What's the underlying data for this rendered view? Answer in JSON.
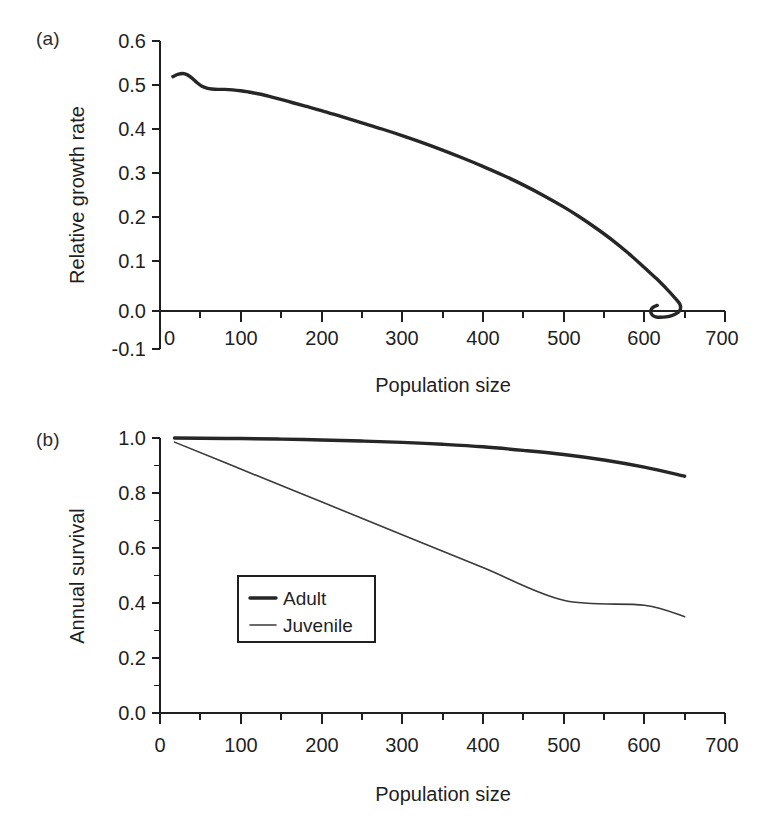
{
  "figure": {
    "panel_a_letter": "(a)",
    "panel_b_letter": "(b)",
    "line_color": "#262626",
    "thin_line_color": "#3a3a3a",
    "background": "#ffffff"
  },
  "chart_data": [
    {
      "type": "line",
      "panel": "(a)",
      "title": "",
      "xlabel": "Population size",
      "ylabel": "Relative growth rate",
      "xlim": [
        0,
        700
      ],
      "ylim": [
        -0.1,
        0.6
      ],
      "xticks": [
        0,
        100,
        200,
        300,
        400,
        500,
        600,
        700
      ],
      "xticklabels": [
        "0",
        "100",
        "200",
        "300",
        "400",
        "500",
        "600",
        "700"
      ],
      "xminorticks": [
        50,
        150,
        250,
        350,
        450,
        550,
        650
      ],
      "yticks": [
        -0.1,
        0.0,
        0.1,
        0.2,
        0.3,
        0.4,
        0.5,
        0.6
      ],
      "yticklabels": [
        "-0.1",
        "0.0",
        "0.1",
        "0.2",
        "0.3",
        "0.4",
        "0.5",
        "0.6"
      ],
      "grid": false,
      "legend": null,
      "series": [
        {
          "name": "Relative growth rate",
          "style": "thick",
          "x": [
            16,
            22,
            28,
            34,
            40,
            46,
            52,
            58,
            64,
            72,
            80,
            90,
            100,
            110,
            125,
            140,
            160,
            180,
            200,
            225,
            250,
            275,
            300,
            325,
            350,
            375,
            400,
            425,
            450,
            475,
            500,
            520,
            540,
            560,
            580,
            600,
            615,
            628,
            637,
            643,
            645,
            644,
            640,
            634,
            627,
            620,
            614,
            610,
            608,
            609,
            612,
            616
          ],
          "y": [
            0.519,
            0.524,
            0.526,
            0.523,
            0.515,
            0.505,
            0.497,
            0.493,
            0.491,
            0.49,
            0.49,
            0.489,
            0.487,
            0.484,
            0.479,
            0.472,
            0.462,
            0.452,
            0.442,
            0.428,
            0.414,
            0.4,
            0.385,
            0.369,
            0.352,
            0.334,
            0.315,
            0.295,
            0.273,
            0.249,
            0.223,
            0.2,
            0.175,
            0.148,
            0.118,
            0.085,
            0.06,
            0.036,
            0.018,
            0.005,
            -0.004,
            -0.012,
            -0.019,
            -0.024,
            -0.027,
            -0.028,
            -0.027,
            -0.023,
            -0.016,
            -0.009,
            -0.004,
            -0.001
          ]
        }
      ]
    },
    {
      "type": "line",
      "panel": "(b)",
      "title": "",
      "xlabel": "Population size",
      "ylabel": "Annual survival",
      "xlim": [
        0,
        700
      ],
      "ylim": [
        0.0,
        1.0
      ],
      "xticks": [
        0,
        100,
        200,
        300,
        400,
        500,
        600,
        700
      ],
      "xticklabels": [
        "0",
        "100",
        "200",
        "300",
        "400",
        "500",
        "600",
        "700"
      ],
      "xminorticks": [
        50,
        150,
        250,
        350,
        450,
        550,
        650
      ],
      "yticks": [
        0.0,
        0.2,
        0.4,
        0.6,
        0.8,
        1.0
      ],
      "yticklabels": [
        "0.0",
        "0.2",
        "0.4",
        "0.6",
        "0.8",
        "1.0"
      ],
      "yminorticks": [
        0.1,
        0.3,
        0.5,
        0.7,
        0.9
      ],
      "grid": false,
      "legend": {
        "position": "center-left",
        "entries": [
          {
            "label": "Adult",
            "style": "thick"
          },
          {
            "label": "Juvenile",
            "style": "thin"
          }
        ]
      },
      "series": [
        {
          "name": "Adult",
          "style": "thick",
          "x": [
            18,
            50,
            100,
            150,
            200,
            250,
            300,
            350,
            400,
            450,
            500,
            550,
            600,
            650
          ],
          "y": [
            1.0,
            0.999,
            0.998,
            0.996,
            0.993,
            0.989,
            0.984,
            0.977,
            0.968,
            0.955,
            0.94,
            0.92,
            0.894,
            0.861
          ]
        },
        {
          "name": "Juvenile",
          "style": "thin",
          "x": [
            18,
            100,
            200,
            300,
            400,
            500,
            600,
            650
          ],
          "y": [
            0.985,
            0.887,
            0.768,
            0.648,
            0.529,
            0.41,
            0.392,
            0.35
          ]
        }
      ]
    }
  ]
}
